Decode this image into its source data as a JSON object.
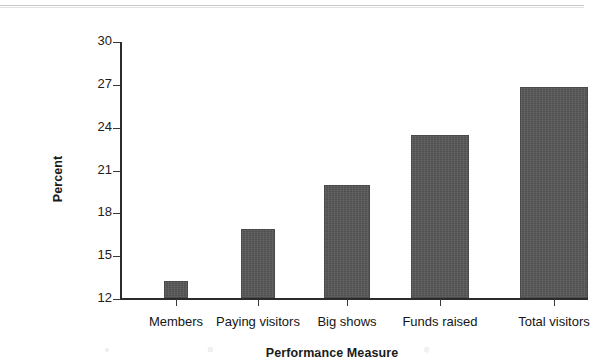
{
  "chart_data": {
    "type": "bar",
    "title": "",
    "xlabel": "Performance Measure",
    "ylabel": "Percent",
    "categories": [
      "Members",
      "Paying visitors",
      "Big shows",
      "Funds raised",
      "Total visitors"
    ],
    "values": [
      13.2,
      16.8,
      19.9,
      23.4,
      26.8
    ],
    "ylim": [
      12,
      30
    ],
    "yticks": [
      12,
      15,
      18,
      21,
      24,
      27,
      30
    ],
    "ytick_labels": [
      "12",
      "15",
      "18",
      "21",
      "24",
      "27",
      "30"
    ],
    "grid": false,
    "legend": null,
    "bar_color": "#575757",
    "axis_color": "#2b2b2b",
    "text_color": "#151515"
  }
}
